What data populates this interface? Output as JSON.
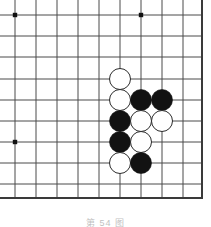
{
  "figure": {
    "caption": "第 54 图",
    "caption_visible": "partially cut off at bottom edge"
  },
  "board": {
    "background_color": "#ffffff",
    "line_color": "#4a4a4a",
    "line_width": 1,
    "border_color": "#3a3a3a",
    "border_width": 2,
    "star_point_color": "#111111",
    "star_point_radius": 2.2,
    "origin_x": 15,
    "origin_y": 15,
    "spacing": 21,
    "columns": 9,
    "rows": 9,
    "vertical_lines_x": [
      15,
      36,
      57,
      78,
      99,
      120,
      141,
      162,
      183
    ],
    "horizontal_lines_y": [
      15,
      36,
      57,
      79,
      100,
      121,
      142,
      163,
      184
    ],
    "right_border_x": 202,
    "bottom_border_y": 198,
    "star_points": [
      {
        "x": 15,
        "y": 15
      },
      {
        "x": 141,
        "y": 15
      },
      {
        "x": 15,
        "y": 142
      }
    ]
  },
  "stones": {
    "radius": 10.5,
    "black_fill": "#121212",
    "white_fill": "#ffffff",
    "white_stroke": "#2b2b2b",
    "items": [
      {
        "id": "stone-1",
        "color": "white",
        "cx": 120,
        "cy": 79,
        "col": 6,
        "row": 4
      },
      {
        "id": "stone-2",
        "color": "white",
        "cx": 120,
        "cy": 100,
        "col": 6,
        "row": 5
      },
      {
        "id": "stone-3",
        "color": "black",
        "cx": 141,
        "cy": 100,
        "col": 7,
        "row": 5
      },
      {
        "id": "stone-4",
        "color": "black",
        "cx": 162,
        "cy": 100,
        "col": 8,
        "row": 5
      },
      {
        "id": "stone-5",
        "color": "black",
        "cx": 120,
        "cy": 121,
        "col": 6,
        "row": 6
      },
      {
        "id": "stone-6",
        "color": "white",
        "cx": 141,
        "cy": 121,
        "col": 7,
        "row": 6
      },
      {
        "id": "stone-7",
        "color": "white",
        "cx": 162,
        "cy": 121,
        "col": 8,
        "row": 6
      },
      {
        "id": "stone-8",
        "color": "black",
        "cx": 120,
        "cy": 142,
        "col": 6,
        "row": 7
      },
      {
        "id": "stone-9",
        "color": "white",
        "cx": 141,
        "cy": 142,
        "col": 7,
        "row": 7
      },
      {
        "id": "stone-10",
        "color": "white",
        "cx": 120,
        "cy": 163,
        "col": 6,
        "row": 8
      },
      {
        "id": "stone-11",
        "color": "black",
        "cx": 141,
        "cy": 163,
        "col": 7,
        "row": 8
      }
    ],
    "black_count": 5,
    "white_count": 6,
    "total_count": 11
  }
}
